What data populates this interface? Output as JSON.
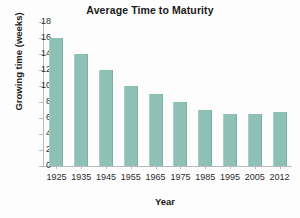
{
  "chart_data": {
    "type": "bar",
    "title": "Average Time to Maturity",
    "xlabel": "Year",
    "ylabel": "Growing time (weeks)",
    "categories": [
      "1925",
      "1935",
      "1945",
      "1955",
      "1965",
      "1975",
      "1985",
      "1995",
      "2005",
      "2012"
    ],
    "values": [
      16,
      14,
      12,
      10,
      9,
      8,
      7,
      6.5,
      6.5,
      6.8
    ],
    "ylim": [
      0,
      18
    ],
    "ytick_labels": [
      "18",
      "16",
      "14",
      "12",
      "10",
      "8",
      "6",
      "4",
      "2",
      "0"
    ],
    "ytick_values": [
      18,
      16,
      14,
      12,
      10,
      8,
      6,
      4,
      2,
      0
    ],
    "ystep": 2,
    "grid": false,
    "legend": false,
    "bar_color": "#8fc0b6",
    "axis_color": "#b9bcbe",
    "text_color": "#1a1a1a",
    "background": "#ffffff"
  }
}
